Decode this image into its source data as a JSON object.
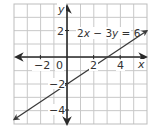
{
  "chart_data": {
    "type": "line",
    "title": "",
    "xlabel": "x",
    "ylabel": "y",
    "xlim": [
      -4,
      6
    ],
    "ylim": [
      -5,
      4
    ],
    "grid": true,
    "grid_step": 1,
    "x_ticks": [
      -2,
      0,
      2,
      4
    ],
    "x_tick_labels": [
      "−2",
      "0",
      "2",
      "4"
    ],
    "y_ticks": [
      2,
      -2,
      -4
    ],
    "y_tick_labels": [
      "2",
      "−2",
      "−4"
    ],
    "series": [
      {
        "name": "2x − 3y = 6",
        "equation": "2x − 3y = 6",
        "slope": 0.6667,
        "intercept": -2,
        "x": [
          -4,
          0,
          3,
          6
        ],
        "y": [
          -4.667,
          -2,
          0,
          2
        ],
        "arrows": "both"
      }
    ],
    "annotations": [
      {
        "text": "2x − 3y = 6",
        "x": 3.3,
        "y": 2.1
      }
    ]
  },
  "labels": {
    "x_axis": "x",
    "y_axis": "y",
    "equation_parts": {
      "a": "2",
      "x": "x",
      "op1": " − 3",
      "y": "y",
      "rhs": " = 6"
    },
    "x_ticks": [
      "−2",
      "0",
      "2",
      "4"
    ],
    "y_ticks": [
      "2",
      "−2",
      "−4"
    ]
  },
  "colors": {
    "grid": "#c8c8c8",
    "grid_border": "#bdbdbd",
    "axis": "#2a2a2a",
    "line": "#3a3a3a",
    "text": "#333333",
    "background": "#ffffff"
  }
}
